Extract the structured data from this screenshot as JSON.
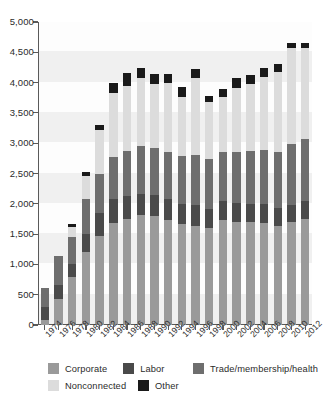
{
  "chart_data": {
    "type": "bar",
    "stacked": true,
    "title": "",
    "subtitle": "",
    "xlabel": "",
    "ylabel": "",
    "ylim": [
      0,
      5000
    ],
    "ytick_step": 500,
    "grid": false,
    "legend_position": "bottom",
    "categories": [
      "1974",
      "1976",
      "1978",
      "1980",
      "1982",
      "1984",
      "1986",
      "1988",
      "1990",
      "1992",
      "1994",
      "1996",
      "1998",
      "2000",
      "2002",
      "2004",
      "2006",
      "2008",
      "2010",
      "2012"
    ],
    "ytick_labels": [
      "0",
      "500",
      "1,000",
      "1,500",
      "2,000",
      "2,500",
      "3,000",
      "3,500",
      "4,000",
      "4,500",
      "5,000"
    ],
    "ytick_values": [
      0,
      500,
      1000,
      1500,
      2000,
      2500,
      3000,
      3500,
      4000,
      4500,
      5000
    ],
    "series": [
      {
        "name": "Corporate",
        "color": "#9a9a9a",
        "values": [
          89,
          433,
          785,
          1204,
          1469,
          1682,
          1744,
          1816,
          1795,
          1735,
          1660,
          1642,
          1597,
          1725,
          1708,
          1694,
          1688,
          1640,
          1694,
          1746
        ]
      },
      {
        "name": "Labor",
        "color": "#4a4a4a",
        "values": [
          201,
          224,
          217,
          297,
          380,
          394,
          384,
          354,
          346,
          347,
          333,
          332,
          321,
          317,
          312,
          303,
          301,
          287,
          290,
          294
        ]
      },
      {
        "name": "Trade/membership/health",
        "color": "#6e6e6e",
        "values": [
          318,
          489,
          451,
          574,
          649,
          698,
          745,
          786,
          774,
          770,
          792,
          838,
          825,
          812,
          833,
          879,
          902,
          926,
          995,
          1023
        ]
      },
      {
        "name": "Nonconnected",
        "color": "#dcdcdc",
        "values": [
          0,
          0,
          165,
          378,
          723,
          1053,
          1077,
          1115,
          1062,
          1145,
          980,
          1259,
          935,
          902,
          1061,
          1096,
          1202,
          1329,
          1594,
          1513
        ]
      },
      {
        "name": "Other",
        "color": "#1a1a1a",
        "values": [
          0,
          0,
          44,
          72,
          76,
          172,
          208,
          163,
          158,
          150,
          163,
          146,
          105,
          136,
          168,
          153,
          144,
          130,
          79,
          81
        ]
      }
    ],
    "totals": [
      608,
      1146,
      1662,
      2525,
      3297,
      3999,
      4158,
      4234,
      4135,
      4147,
      3928,
      4217,
      3783,
      3892,
      4082,
      4125,
      4237,
      4312,
      4652,
      4657
    ]
  },
  "legend": {
    "rows": [
      [
        {
          "label": "Corporate",
          "color": "#9a9a9a"
        },
        {
          "label": "Labor",
          "color": "#4a4a4a"
        },
        {
          "label": "Trade/membership/health",
          "color": "#6e6e6e"
        }
      ],
      [
        {
          "label": "Nonconnected",
          "color": "#dcdcdc"
        },
        {
          "label": "Other",
          "color": "#1a1a1a"
        }
      ]
    ]
  }
}
